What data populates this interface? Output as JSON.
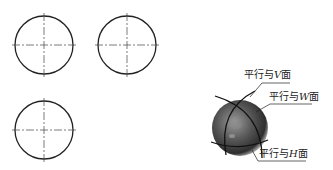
{
  "views": [
    {
      "name": "front-view",
      "cx": 44,
      "cy": 45,
      "r": 29
    },
    {
      "name": "side-view",
      "cx": 127,
      "cy": 45,
      "r": 29
    },
    {
      "name": "top-view",
      "cx": 44,
      "cy": 130,
      "r": 29
    }
  ],
  "sphere": {
    "cx": 240,
    "cy": 128,
    "r": 28
  },
  "labels": {
    "v_plane": {
      "prefix": "平行与",
      "letter": "V",
      "suffix": "面"
    },
    "w_plane": {
      "prefix": "平行与",
      "letter": "W",
      "suffix": "面"
    },
    "h_plane": {
      "prefix": "平行与",
      "letter": "H",
      "suffix": "面"
    }
  },
  "colors": {
    "line": "#222222",
    "sphere_dark": "#3a3a3a",
    "sphere_light": "#bdbdbd"
  }
}
